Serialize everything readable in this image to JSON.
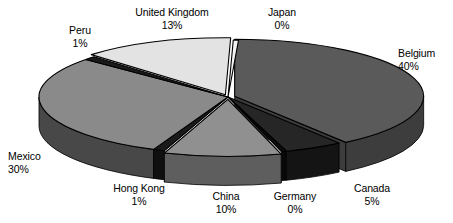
{
  "chart_data": {
    "type": "pie",
    "title": "",
    "subtitle": "",
    "xlabel": "",
    "ylabel": "",
    "style": "3d-exploded-pie",
    "legend_position": "none",
    "grid": false,
    "value_unit": "percent",
    "categories": [
      "Belgium",
      "Canada",
      "Germany",
      "China",
      "Hong Kong",
      "Mexico",
      "Peru",
      "United Kingdom",
      "Japan"
    ],
    "values": [
      40,
      5,
      0,
      10,
      1,
      30,
      1,
      13,
      0
    ],
    "labels": [
      "40%",
      "5%",
      "0%",
      "10%",
      "1%",
      "30%",
      "1%",
      "13%",
      "0%"
    ],
    "slices": [
      {
        "name": "Belgium",
        "value": 40,
        "label": "40%",
        "color": "#5a5a5a",
        "side_color": "#3d3d3d",
        "start_deg": 0.0,
        "end_deg": 144.0,
        "exploded": true
      },
      {
        "name": "Canada",
        "value": 5,
        "label": "5%",
        "color": "#262626",
        "side_color": "#141414",
        "start_deg": 144.0,
        "end_deg": 162.0,
        "exploded": false
      },
      {
        "name": "Germany",
        "value": 0,
        "label": "0%",
        "color": "#0d0d0d",
        "side_color": "#080808",
        "start_deg": 162.0,
        "end_deg": 163.6,
        "exploded": false
      },
      {
        "name": "China",
        "value": 10,
        "label": "10%",
        "color": "#909090",
        "side_color": "#5e5e5e",
        "start_deg": 163.6,
        "end_deg": 199.6,
        "exploded": true
      },
      {
        "name": "Hong Kong",
        "value": 1,
        "label": "1%",
        "color": "#1a1a1a",
        "side_color": "#101010",
        "start_deg": 199.6,
        "end_deg": 203.2,
        "exploded": false
      },
      {
        "name": "Mexico",
        "value": 30,
        "label": "30%",
        "color": "#8a8a8a",
        "side_color": "#484848",
        "start_deg": 203.2,
        "end_deg": 311.2,
        "exploded": false
      },
      {
        "name": "Peru",
        "value": 1,
        "label": "1%",
        "color": "#1a1a1a",
        "side_color": "#101010",
        "start_deg": 311.2,
        "end_deg": 314.8,
        "exploded": false
      },
      {
        "name": "United Kingdom",
        "value": 13,
        "label": "13%",
        "color": "#e3e3e3",
        "side_color": "#9c9c9c",
        "start_deg": 314.8,
        "end_deg": 361.6,
        "exploded": true
      },
      {
        "name": "Japan",
        "value": 0,
        "label": "0%",
        "color": "#f2f2f2",
        "side_color": "#b4b4b4",
        "start_deg": 361.6,
        "end_deg": 363.2,
        "exploded": false
      }
    ]
  },
  "callouts": [
    {
      "name": "United Kingdom",
      "value_label": "13%",
      "x": 172,
      "y": 6,
      "align": "c"
    },
    {
      "name": "Japan",
      "value_label": "0%",
      "x": 282,
      "y": 6,
      "align": "c"
    },
    {
      "name": "Peru",
      "value_label": "1%",
      "x": 80,
      "y": 24,
      "align": "c"
    },
    {
      "name": "Belgium",
      "value_label": "40%",
      "x": 398,
      "y": 47,
      "align": "l"
    },
    {
      "name": "Mexico",
      "value_label": "30%",
      "x": 8,
      "y": 150,
      "align": "l"
    },
    {
      "name": "Hong Kong",
      "value_label": "1%",
      "x": 139,
      "y": 182,
      "align": "c"
    },
    {
      "name": "China",
      "value_label": "10%",
      "x": 226,
      "y": 190,
      "align": "c"
    },
    {
      "name": "Germany",
      "value_label": "0%",
      "x": 295,
      "y": 190,
      "align": "c"
    },
    {
      "name": "Canada",
      "value_label": "5%",
      "x": 372,
      "y": 182,
      "align": "c"
    }
  ],
  "geometry": {
    "cx": 228,
    "cy": 97,
    "rx": 189,
    "ry": 57,
    "depth": 29,
    "explode_px": 7
  },
  "colors": {
    "background": "#ffffff",
    "label_text": "#000000",
    "outline": "#000000"
  }
}
